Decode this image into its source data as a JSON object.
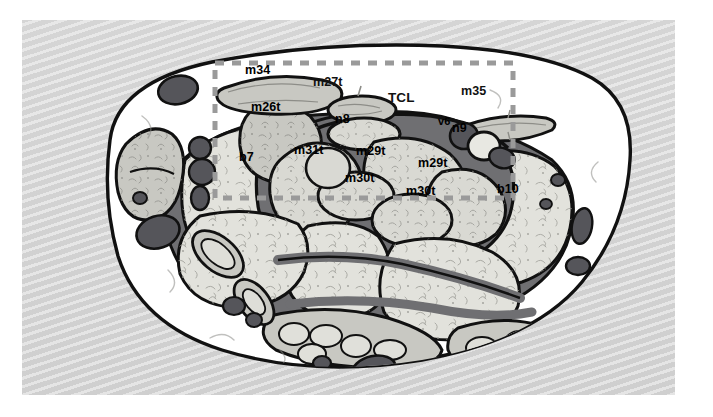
{
  "figure": {
    "type": "anatomical-cross-section",
    "region": "carpal tunnel axial cross-section",
    "panel": {
      "background_color": "#d6d6d6",
      "outer_margin_color": "#ffffff",
      "x": 22,
      "y": 20,
      "width": 653,
      "height": 375
    },
    "palette": {
      "outline": "#111111",
      "skin_fill": "#ffffff",
      "fascia_dark": "#6f6f72",
      "tendon_fill": "#c8c8c2",
      "tendon_light": "#d9d9d3",
      "bone_fill": "#e2e2dc",
      "vessel_dark": "#55555a",
      "nerve_fill": "#e8e8e2",
      "dashed_overlay": "#9a9a9a"
    },
    "roi_box": {
      "name": "dashed-region-of-interest",
      "color": "#9a9a9a",
      "x": 215,
      "y": 63,
      "width": 298,
      "height": 135,
      "dash": "9 8",
      "stroke_width": 5
    }
  },
  "labels": [
    {
      "id": "m34",
      "text": "m34",
      "x": 245,
      "y": 64,
      "size": "mid",
      "on": "tendon",
      "meaning": "tendon m34"
    },
    {
      "id": "m27t",
      "text": "m27t",
      "x": 313,
      "y": 76,
      "size": "mid",
      "on": "white",
      "meaning": "tendon m27t"
    },
    {
      "id": "TCL",
      "text": "TCL",
      "x": 388,
      "y": 91,
      "size": "big",
      "on": "white",
      "meaning": "transverse carpal ligament"
    },
    {
      "id": "m35",
      "text": "m35",
      "x": 461,
      "y": 85,
      "size": "mid",
      "on": "white",
      "meaning": "tendon m35"
    },
    {
      "id": "m26t",
      "text": "m26t",
      "x": 251,
      "y": 101,
      "size": "mid",
      "on": "tendon",
      "meaning": "tendon m26t"
    },
    {
      "id": "n8",
      "text": "n8",
      "x": 335,
      "y": 113,
      "size": "mid",
      "on": "nerve",
      "meaning": "nerve n8 (median nerve)"
    },
    {
      "id": "v6",
      "text": "v6",
      "x": 438,
      "y": 116,
      "size": "small",
      "on": "vessel",
      "meaning": "vessel v6"
    },
    {
      "id": "n9",
      "text": "n9",
      "x": 452,
      "y": 122,
      "size": "mid",
      "on": "nerve",
      "meaning": "nerve n9 (ulnar nerve)"
    },
    {
      "id": "b7",
      "text": "b7",
      "x": 239,
      "y": 151,
      "size": "mid",
      "on": "bone",
      "meaning": "carpal bone b7"
    },
    {
      "id": "m31t",
      "text": "m31t",
      "x": 294,
      "y": 144,
      "size": "mid",
      "on": "tendon",
      "meaning": "tendon m31t"
    },
    {
      "id": "m29t_upper",
      "text": "m29t",
      "x": 356,
      "y": 145,
      "size": "mid",
      "on": "tendon",
      "meaning": "tendon m29t"
    },
    {
      "id": "m29t_lower",
      "text": "m29t",
      "x": 418,
      "y": 157,
      "size": "mid",
      "on": "tendon",
      "meaning": "tendon m29t"
    },
    {
      "id": "m30t_upper",
      "text": "m30t",
      "x": 345,
      "y": 172,
      "size": "mid",
      "on": "tendon",
      "meaning": "tendon m30t"
    },
    {
      "id": "m30t_lower",
      "text": "m30t",
      "x": 406,
      "y": 185,
      "size": "mid",
      "on": "tendon",
      "meaning": "tendon m30t"
    },
    {
      "id": "b10",
      "text": "b10",
      "x": 497,
      "y": 183,
      "size": "mid",
      "on": "bone",
      "meaning": "carpal bone b10"
    }
  ]
}
